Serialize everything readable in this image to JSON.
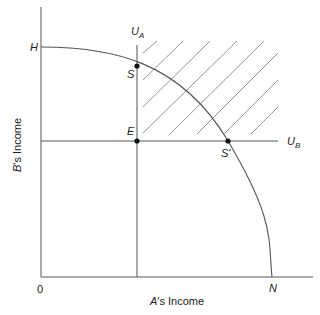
{
  "diagram": {
    "axes": {
      "x_label_var": "A",
      "x_label_rest": "'s Income",
      "y_label_var": "B",
      "y_label_rest": "'s Income",
      "origin": "0"
    },
    "points": {
      "H": "H",
      "N": "N",
      "S": "S",
      "S_prime": "S'",
      "E": "E"
    },
    "lines": {
      "UA_main": "U",
      "UA_sub": "A",
      "UB_main": "U",
      "UB_sub": "B"
    },
    "colors": {
      "line": "#555555",
      "hatch": "#666666",
      "dot": "#111111"
    }
  }
}
